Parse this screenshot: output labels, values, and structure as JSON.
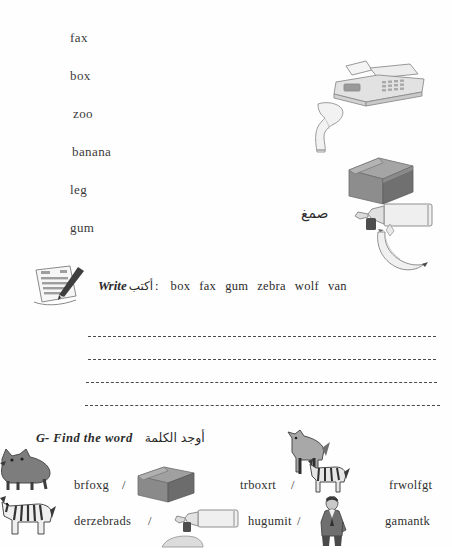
{
  "document": {
    "type": "worksheet",
    "language_primary": "en",
    "language_secondary": "ar"
  },
  "word_list": {
    "name": "vocabulary-word-list",
    "words": [
      "fax",
      "box",
      "zoo",
      "banana",
      "leg",
      "gum"
    ]
  },
  "picture_column": {
    "items": [
      {
        "icon": "fax-machine-image",
        "label": "fax"
      },
      {
        "icon": "leg-image",
        "label": "leg"
      },
      {
        "icon": "cardboard-box-image",
        "label": "box"
      },
      {
        "icon": "glue-tube-image",
        "label": "gum"
      },
      {
        "icon": "banana-image",
        "label": "banana"
      }
    ],
    "glue_arabic_label": "صمغ"
  },
  "write_section": {
    "icon": "notepad-pencil-image",
    "label_en": "Write",
    "label_ar": "أكتب",
    "colon": ":",
    "words": [
      "box",
      "fax",
      "gum",
      "zebra",
      "wolf",
      "van"
    ],
    "answer_lines": 4
  },
  "find_section": {
    "letter": "G-",
    "label_en": "Find  the  word",
    "label_ar": "أوجد الكلمة",
    "separator": "/",
    "rows": [
      {
        "cells": [
          {
            "kind": "text",
            "value": "brfoxg"
          },
          {
            "kind": "separator",
            "value": "/"
          },
          {
            "kind": "image",
            "icon": "cardboard-box-image"
          },
          {
            "kind": "text",
            "value": "trboxrt"
          },
          {
            "kind": "separator",
            "value": "/"
          },
          {
            "kind": "image",
            "icon": "zebra-image"
          },
          {
            "kind": "text",
            "value": "frwolfgt"
          }
        ]
      },
      {
        "cells": [
          {
            "kind": "text",
            "value": "derzebrads"
          },
          {
            "kind": "separator",
            "value": "/"
          },
          {
            "kind": "image",
            "icon": "glue-tube-image"
          },
          {
            "kind": "text",
            "value": "hugumit"
          },
          {
            "kind": "separator",
            "value": "/"
          },
          {
            "kind": "image",
            "icon": "man-in-suit-image"
          },
          {
            "kind": "text",
            "value": "gamantk"
          }
        ]
      }
    ],
    "decor_images": [
      {
        "icon": "wolf-image"
      },
      {
        "icon": "zebra-image"
      },
      {
        "icon": "howling-wolf-image"
      }
    ]
  },
  "colors": {
    "page_background": "#fefefe",
    "text": "#2b2b2b",
    "line": "#4a4a4a",
    "box_front": "#8a8a8a",
    "box_top": "#a5a5a5",
    "box_side": "#6f6f6f",
    "image_grey": "#bdbdbd"
  }
}
